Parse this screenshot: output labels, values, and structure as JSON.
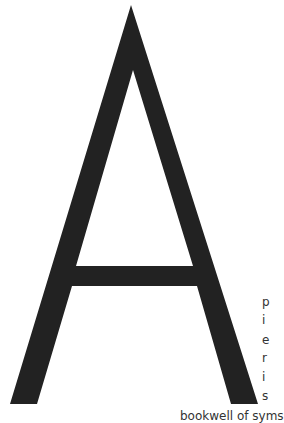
{
  "artwork": {
    "letter": "A",
    "fill_color": "#222222",
    "background": "#ffffff"
  },
  "side_text": {
    "chars": [
      "p",
      "i",
      "e",
      "r",
      "i",
      "s"
    ]
  },
  "bottom_text": "bookwell of syms"
}
